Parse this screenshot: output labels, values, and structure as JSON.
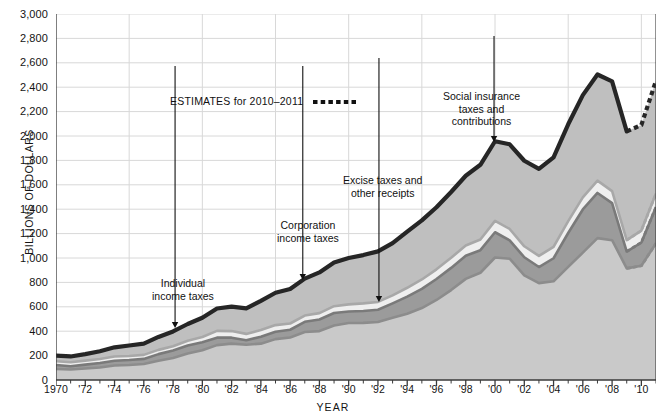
{
  "chart": {
    "type": "area",
    "yaxis_label": "BILLIONS OF DOLLARS",
    "xaxis_label": "YEAR",
    "ylim": [
      0,
      3000
    ],
    "ytick_values": [
      0,
      200,
      400,
      600,
      800,
      1000,
      1200,
      1400,
      1600,
      1800,
      2000,
      2200,
      2400,
      2600,
      2800,
      3000
    ],
    "ytick_labels": [
      "0",
      "200",
      "400",
      "600",
      "800",
      "1,000",
      "1,200",
      "1,400",
      "1,600",
      "1,800",
      "2,000",
      "2,200",
      "2,400",
      "2,600",
      "2,800",
      "3,000"
    ],
    "xlim": [
      1970,
      2011
    ],
    "xtick_labels": [
      "1970",
      "'72",
      "'74",
      "'76",
      "'78",
      "'80",
      "'82",
      "'84",
      "'86",
      "'88",
      "'90",
      "'92",
      "'94",
      "'96",
      "'98",
      "'00",
      "'02",
      "'04",
      "'06",
      "'08",
      "'10"
    ],
    "xtick_values": [
      1970,
      1972,
      1974,
      1976,
      1978,
      1980,
      1982,
      1984,
      1986,
      1988,
      1990,
      1992,
      1994,
      1996,
      1998,
      2000,
      2002,
      2004,
      2006,
      2008,
      2010
    ],
    "grid": {
      "horizontal": true,
      "vertical": true,
      "vertical_every_years": 5
    },
    "estimates_start_year": 2009
  },
  "chart_data": {
    "type": "area",
    "title": "",
    "xlabel": "YEAR",
    "ylabel": "BILLIONS OF DOLLARS",
    "ylim": [
      0,
      3000
    ],
    "xlim": [
      1970,
      2011
    ],
    "stacked": true,
    "x": [
      1970,
      1971,
      1972,
      1973,
      1974,
      1975,
      1976,
      1977,
      1978,
      1979,
      1980,
      1981,
      1982,
      1983,
      1984,
      1985,
      1986,
      1987,
      1988,
      1989,
      1990,
      1991,
      1992,
      1993,
      1994,
      1995,
      1996,
      1997,
      1998,
      1999,
      2000,
      2001,
      2002,
      2003,
      2004,
      2005,
      2006,
      2007,
      2008,
      2009,
      2010,
      2011
    ],
    "series": [
      {
        "name": "Individual income taxes",
        "color": "#c9c9c9",
        "values": [
          90,
          86,
          94,
          103,
          119,
          123,
          131,
          157,
          181,
          217,
          244,
          286,
          298,
          289,
          298,
          335,
          349,
          393,
          401,
          446,
          467,
          468,
          476,
          510,
          543,
          590,
          656,
          737,
          829,
          879,
          1004,
          994,
          858,
          794,
          809,
          927,
          1044,
          1163,
          1146,
          915,
          936,
          1121
        ]
      },
      {
        "name": "Corporation income taxes",
        "color": "#9b9b9b",
        "values": [
          33,
          27,
          32,
          36,
          39,
          41,
          42,
          55,
          60,
          66,
          65,
          61,
          49,
          37,
          57,
          61,
          63,
          84,
          95,
          103,
          94,
          98,
          100,
          118,
          140,
          157,
          172,
          182,
          189,
          185,
          207,
          151,
          148,
          132,
          189,
          278,
          354,
          370,
          304,
          138,
          191,
          297
        ]
      },
      {
        "name": "Excise taxes and other receipts",
        "color": "#efefef",
        "values": [
          31,
          32,
          33,
          33,
          34,
          33,
          33,
          35,
          36,
          38,
          43,
          56,
          54,
          52,
          55,
          54,
          51,
          51,
          52,
          56,
          59,
          62,
          64,
          66,
          73,
          77,
          79,
          83,
          84,
          88,
          93,
          93,
          90,
          91,
          93,
          97,
          99,
          101,
          98,
          94,
          98,
          110
        ]
      },
      {
        "name": "Social insurance taxes and contributions",
        "color": "#bfbfbf",
        "values": [
          46,
          48,
          53,
          64,
          76,
          86,
          92,
          106,
          121,
          138,
          158,
          183,
          201,
          209,
          239,
          265,
          283,
          303,
          334,
          359,
          380,
          396,
          414,
          428,
          461,
          484,
          509,
          539,
          572,
          612,
          653,
          694,
          701,
          713,
          733,
          794,
          838,
          870,
          900,
          891,
          865,
          925
        ]
      }
    ],
    "totals": [
      200,
      193,
      212,
      236,
      268,
      283,
      298,
      353,
      398,
      459,
      510,
      586,
      602,
      587,
      649,
      715,
      746,
      831,
      882,
      964,
      1000,
      1024,
      1054,
      1122,
      1217,
      1308,
      1416,
      1541,
      1674,
      1764,
      1957,
      1932,
      1797,
      1730,
      1824,
      2096,
      2335,
      2504,
      2448,
      2038,
      2090,
      2453
    ],
    "annotations": [
      {
        "id": "estimates",
        "text": "ESTIMATES for 2010–2011",
        "style": "dotted-legend"
      },
      {
        "id": "individual",
        "text": "Individual\nincome taxes",
        "points_to": "Individual income taxes band"
      },
      {
        "id": "corporation",
        "text": "Corporation\nincome taxes",
        "points_to": "Corporation income taxes band"
      },
      {
        "id": "excise",
        "text": "Excise taxes and\nother receipts",
        "points_to": "Excise taxes and other receipts band"
      },
      {
        "id": "social",
        "text": "Social insurance\ntaxes and\ncontributions",
        "points_to": "Social insurance taxes and contributions band"
      }
    ],
    "legend_position": "inline-annotations",
    "colors": {
      "outline": "#262626",
      "gridline": "#d8d8d8",
      "axis": "#3a3a3a",
      "individual": "#c9c9c9",
      "corporation": "#9b9b9b",
      "excise": "#efefef",
      "social": "#bfbfbf"
    }
  },
  "annotations": {
    "estimates_label": "ESTIMATES for 2010–2011",
    "individual_line1": "Individual",
    "individual_line2": "income taxes",
    "corporation_line1": "Corporation",
    "corporation_line2": "income taxes",
    "excise_line1": "Excise taxes and",
    "excise_line2": "other receipts",
    "social_line1": "Social insurance",
    "social_line2": "taxes and",
    "social_line3": "contributions"
  }
}
